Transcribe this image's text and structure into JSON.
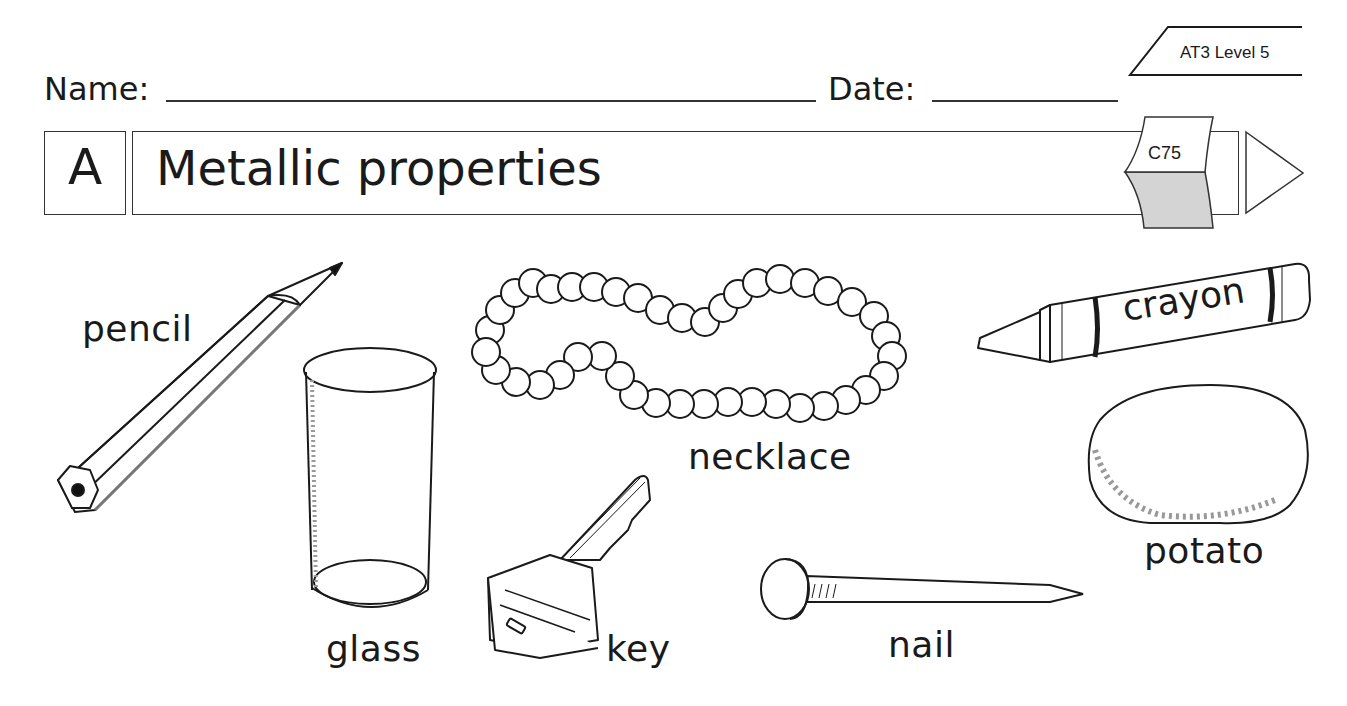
{
  "header": {
    "name_label": "Name:",
    "date_label": "Date:",
    "level_tag": "AT3 Level 5",
    "code_tag": "C75"
  },
  "title": {
    "section_letter": "A",
    "text": "Metallic properties"
  },
  "items": [
    {
      "label": "pencil",
      "icon": "pencil-icon"
    },
    {
      "label": "glass",
      "icon": "glass-icon"
    },
    {
      "label": "necklace",
      "icon": "necklace-icon"
    },
    {
      "label": "key",
      "icon": "key-icon"
    },
    {
      "label": "crayon",
      "icon": "crayon-icon"
    },
    {
      "label": "nail",
      "icon": "nail-icon"
    },
    {
      "label": "potato",
      "icon": "potato-icon"
    }
  ],
  "colors": {
    "ink": "#1a1a1a",
    "tab_fill": "#d4d4d4"
  }
}
